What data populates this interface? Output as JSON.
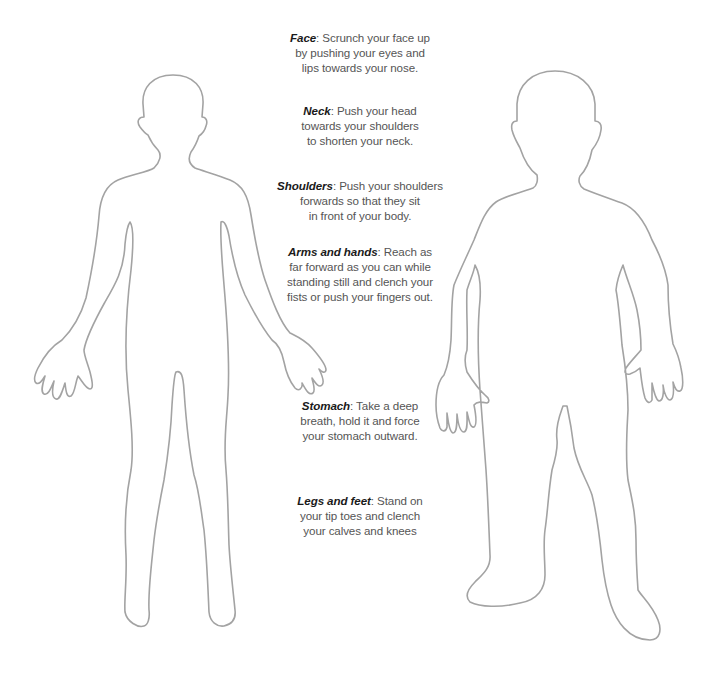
{
  "figures": {
    "left": {
      "name": "front-body-outline",
      "stroke": "#a3a3a3"
    },
    "right": {
      "name": "side-tense-body-outline",
      "stroke": "#a3a3a3"
    }
  },
  "instructions": [
    {
      "label": "Face",
      "sep": ":",
      "lines": [
        "Scrunch your face up",
        "by pushing your eyes and",
        "lips towards your nose."
      ]
    },
    {
      "label": "Neck",
      "sep": ":",
      "lines": [
        "Push your head",
        "towards your shoulders",
        "to shorten your neck."
      ]
    },
    {
      "label": "Shoulders",
      "sep": ":",
      "lines": [
        "Push your shoulders",
        "forwards so that they sit",
        "in front of your body."
      ]
    },
    {
      "label": "Arms and hands",
      "sep": ":",
      "lines": [
        "Reach as",
        "far forward as you can while",
        "standing still and clench your",
        "fists or push your fingers out."
      ]
    },
    {
      "label": "Stomach",
      "sep": ":",
      "lines": [
        "Take a deep",
        "breath, hold it and force",
        "your stomach outward."
      ]
    },
    {
      "label": "Legs and feet",
      "sep": ":",
      "lines": [
        "Stand on",
        "your tip toes and clench",
        "your calves and knees"
      ]
    }
  ],
  "colors": {
    "label": "#1a1a1a",
    "body_text": "#555555",
    "outline": "#a3a3a3",
    "background": "#ffffff"
  }
}
